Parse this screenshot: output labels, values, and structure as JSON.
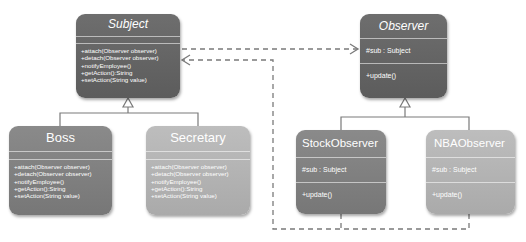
{
  "diagram": {
    "type": "UML class diagram",
    "pattern": "Observer",
    "colors": {
      "dark_box": "#626262",
      "mid_box": "#7d7d7d",
      "light_box": "#b0b0b0",
      "line": "#7a7a7a",
      "text": "#ffffff"
    },
    "classes": {
      "subject": {
        "name": "Subject",
        "abstract": true,
        "attributes": [],
        "operations": [
          "+attach(Observer observer)",
          "+detach(Observer observer)",
          "+notifyEmployee()",
          "+getAction():String",
          "+setAction(String value)"
        ]
      },
      "boss": {
        "name": "Boss",
        "attributes": [],
        "operations": [
          "+attach(Observer observer)",
          "+detach(Observer observer)",
          "+notifyEmployee()",
          "+getAction():String",
          "+setAction(String value)"
        ]
      },
      "secretary": {
        "name": "Secretary",
        "attributes": [],
        "operations": [
          "+attach(Observer observer)",
          "+detach(Observer observer)",
          "+notifyEmployee()",
          "+getAction():String",
          "+setAction(String value)"
        ]
      },
      "observer": {
        "name": "Observer",
        "abstract": true,
        "attributes": [
          "#sub : Subject"
        ],
        "operations": [
          "+update()"
        ]
      },
      "stock_observer": {
        "name": "StockObserver",
        "attributes": [
          "#sub : Subject"
        ],
        "operations": [
          "+update()"
        ]
      },
      "nba_observer": {
        "name": "NBAObserver",
        "attributes": [
          "#sub : Subject"
        ],
        "operations": [
          "+update()"
        ]
      }
    },
    "relationships": [
      {
        "type": "generalization",
        "from": "Boss",
        "to": "Subject"
      },
      {
        "type": "generalization",
        "from": "Secretary",
        "to": "Subject"
      },
      {
        "type": "generalization",
        "from": "StockObserver",
        "to": "Observer"
      },
      {
        "type": "generalization",
        "from": "NBAObserver",
        "to": "Observer"
      },
      {
        "type": "dependency",
        "from": "Subject",
        "to": "Observer"
      },
      {
        "type": "dependency",
        "from": "StockObserver",
        "to": "Subject"
      },
      {
        "type": "dependency",
        "from": "NBAObserver",
        "to": "Subject"
      }
    ]
  }
}
